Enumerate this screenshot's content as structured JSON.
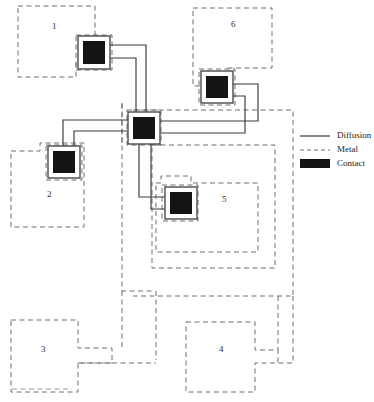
{
  "diagram": {
    "colors": {
      "diffusion_line": "#3a3a3a",
      "metal_line": "#6e6e6e",
      "contact_fill": "#141414",
      "contact_border": "#4a4a4a",
      "text": "#2b2b2b",
      "background": "#ffffff"
    },
    "legend": {
      "items": [
        {
          "label": "Diffusion",
          "style": "solid-line",
          "swatch": "diffusion-line-swatch"
        },
        {
          "label": "Metal",
          "style": "dashed-line",
          "swatch": "metal-line-swatch"
        },
        {
          "label": "Contact",
          "style": "filled-rect",
          "swatch": "contact-rect-swatch"
        }
      ]
    },
    "regions": [
      {
        "id": "1",
        "label": "1",
        "label_x": 52,
        "label_y": 22,
        "kind": "metal"
      },
      {
        "id": "2",
        "label": "2",
        "label_x": 47,
        "label_y": 190,
        "kind": "metal"
      },
      {
        "id": "3",
        "label": "3",
        "label_x": 41,
        "label_y": 345,
        "kind": "metal"
      },
      {
        "id": "4",
        "label": "4",
        "label_x": 219,
        "label_y": 345,
        "kind": "metal"
      },
      {
        "id": "5",
        "label": "5",
        "label_x": 222,
        "label_y": 195,
        "kind": "metal"
      },
      {
        "id": "6",
        "label": "6",
        "label_x": 231,
        "label_y": 20,
        "kind": "metal"
      }
    ],
    "contacts": [
      {
        "id": "contact-region-1",
        "x": 80,
        "y": 38,
        "w": 28,
        "h": 29
      },
      {
        "id": "contact-region-6",
        "x": 203,
        "y": 73,
        "w": 28,
        "h": 28
      },
      {
        "id": "contact-hub",
        "x": 130,
        "y": 114,
        "w": 28,
        "h": 28
      },
      {
        "id": "contact-region-2",
        "x": 50,
        "y": 148,
        "w": 28,
        "h": 28
      },
      {
        "id": "contact-region-5",
        "x": 167,
        "y": 189,
        "w": 28,
        "h": 27
      }
    ],
    "nets": [
      {
        "id": "net-hub-to-contact-1",
        "from": "contact-hub",
        "to": "contact-region-1"
      },
      {
        "id": "net-hub-to-contact-6",
        "from": "contact-hub",
        "to": "contact-region-6"
      },
      {
        "id": "net-hub-to-contact-2",
        "from": "contact-hub",
        "to": "contact-region-2"
      },
      {
        "id": "net-hub-to-contact-5",
        "from": "contact-hub",
        "to": "contact-region-5"
      }
    ]
  }
}
